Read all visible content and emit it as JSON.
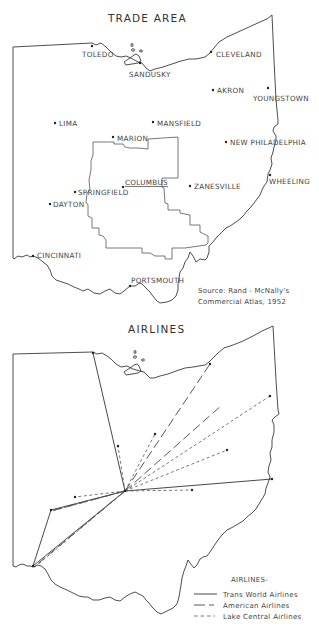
{
  "trade_map": {
    "title": "TRADE AREA",
    "cities": [
      {
        "name": "TOLEDO",
        "x": 92,
        "y": 46,
        "lx": 82,
        "ly": 57
      },
      {
        "name": "SANDUSKY",
        "x": 140,
        "y": 63,
        "lx": 129,
        "ly": 77
      },
      {
        "name": "CLEVELAND",
        "x": 211,
        "y": 52,
        "lx": 216,
        "ly": 57
      },
      {
        "name": "AKRON",
        "x": 213,
        "y": 90,
        "lx": 217,
        "ly": 93
      },
      {
        "name": "YOUNGSTOWN",
        "x": 268,
        "y": 88,
        "lx": 253,
        "ly": 101
      },
      {
        "name": "LIMA",
        "x": 55,
        "y": 123,
        "lx": 59,
        "ly": 126
      },
      {
        "name": "MANSFIELD",
        "x": 153,
        "y": 122,
        "lx": 157,
        "ly": 126
      },
      {
        "name": "MARION",
        "x": 113,
        "y": 137,
        "lx": 117,
        "ly": 141
      },
      {
        "name": "NEW PHILADELPHIA",
        "x": 226,
        "y": 142,
        "lx": 230,
        "ly": 145
      },
      {
        "name": "WHEELING",
        "x": 270,
        "y": 175,
        "lx": 269,
        "ly": 184
      },
      {
        "name": "COLUMBUS",
        "x": 123,
        "y": 187,
        "lx": 125,
        "ly": 185,
        "underline": true
      },
      {
        "name": "ZANESVILLE",
        "x": 190,
        "y": 186,
        "lx": 194,
        "ly": 189
      },
      {
        "name": "SPRINGFIELD",
        "x": 75,
        "y": 192,
        "lx": 78,
        "ly": 195
      },
      {
        "name": "DAYTON",
        "x": 50,
        "y": 204,
        "lx": 53,
        "ly": 207
      },
      {
        "name": "CINCINNATI",
        "x": 33,
        "y": 256,
        "lx": 37,
        "ly": 258
      },
      {
        "name": "PORTSMOUTH",
        "x": 130,
        "y": 286,
        "lx": 131,
        "ly": 283
      }
    ],
    "source_note": {
      "line1": "Source:  Rand - McNally's",
      "line2": "Commercial  Atlas, 1952"
    }
  },
  "airline_map": {
    "title": "AIRLINES",
    "hub": {
      "x": 125,
      "y": 491
    },
    "routes": [
      {
        "airline": "Trans World Airlines",
        "from": [
          125,
          491
        ],
        "to": [
          93,
          353
        ]
      },
      {
        "airline": "Trans World Airlines",
        "from": [
          125,
          491
        ],
        "to": [
          272,
          479
        ]
      },
      {
        "airline": "Trans World Airlines",
        "from": [
          125,
          491
        ],
        "to": [
          51,
          510
        ]
      },
      {
        "airline": "Trans World Airlines",
        "from": [
          125,
          491
        ],
        "to": [
          33,
          566
        ]
      },
      {
        "airline": "Trans World Airlines",
        "from": [
          51,
          510
        ],
        "to": [
          33,
          566
        ]
      },
      {
        "airline": "American Airlines",
        "from": [
          125,
          491
        ],
        "to": [
          210,
          364
        ]
      },
      {
        "airline": "American Airlines",
        "from": [
          125,
          491
        ],
        "to": [
          222,
          405
        ]
      },
      {
        "airline": "American Airlines",
        "from": [
          125,
          491
        ],
        "to": [
          51,
          511
        ]
      },
      {
        "airline": "American Airlines",
        "from": [
          125,
          491
        ],
        "to": [
          34,
          567
        ]
      },
      {
        "airline": "Lake Central Airlines",
        "from": [
          125,
          491
        ],
        "to": [
          270,
          396
        ]
      },
      {
        "airline": "Lake Central Airlines",
        "from": [
          125,
          491
        ],
        "to": [
          227,
          450
        ]
      },
      {
        "airline": "Lake Central Airlines",
        "from": [
          125,
          491
        ],
        "to": [
          155,
          434
        ]
      },
      {
        "airline": "Lake Central Airlines",
        "from": [
          125,
          491
        ],
        "to": [
          118,
          446
        ]
      },
      {
        "airline": "Lake Central Airlines",
        "from": [
          125,
          491
        ],
        "to": [
          192,
          490
        ]
      },
      {
        "airline": "Lake Central Airlines",
        "from": [
          125,
          491
        ],
        "to": [
          75,
          497
        ]
      },
      {
        "airline": "Lake Central Airlines",
        "from": [
          125,
          491
        ],
        "to": [
          52,
          511
        ]
      },
      {
        "airline": "Lake Central Airlines",
        "from": [
          125,
          491
        ],
        "to": [
          35,
          567
        ]
      }
    ],
    "stops": [
      [
        93,
        353
      ],
      [
        210,
        364
      ],
      [
        270,
        396
      ],
      [
        155,
        434
      ],
      [
        118,
        446
      ],
      [
        227,
        450
      ],
      [
        272,
        479
      ],
      [
        125,
        491
      ],
      [
        192,
        490
      ],
      [
        75,
        497
      ],
      [
        51,
        510
      ],
      [
        33,
        566
      ]
    ],
    "legend": {
      "title": "AIRLINES-",
      "items": [
        {
          "label": "Trans World Airlines",
          "style": "solid"
        },
        {
          "label": "American Airlines",
          "style": "long-dash"
        },
        {
          "label": "Lake Central Airlines",
          "style": "short-dash"
        }
      ]
    }
  }
}
